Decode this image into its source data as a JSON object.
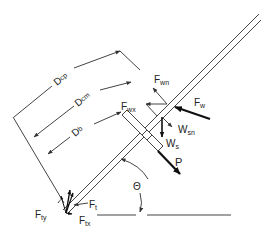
{
  "diagram": {
    "type": "free-body diagram",
    "colors": {
      "background": "#ffffff",
      "line": "#333333",
      "text": "#222222"
    },
    "labels": {
      "dcp": {
        "main": "D",
        "sub": "cp"
      },
      "dcm": {
        "main": "D",
        "sub": "cm"
      },
      "db": {
        "main": "D",
        "sub": "b"
      },
      "fwn": {
        "main": "F",
        "sub": "wn"
      },
      "fwx": {
        "main": "F",
        "sub": "wx"
      },
      "fw": {
        "main": "F",
        "sub": "w"
      },
      "wsn": {
        "main": "W",
        "sub": "sn"
      },
      "ws": {
        "main": "W",
        "sub": "s"
      },
      "p": {
        "main": "P"
      },
      "theta": {
        "main": "Θ"
      },
      "ft": {
        "main": "F",
        "sub": "t"
      },
      "fty": {
        "main": "F",
        "sub": "ty"
      },
      "ftx": {
        "main": "F",
        "sub": "tx"
      }
    },
    "elements": [
      "pole (double line)",
      "hand grip / block on pole",
      "dimension line Dcp",
      "dimension line Dcm",
      "dimension line Db",
      "wind force Fw and components Fwn, Fwx",
      "weight Ws and normal component Wsn",
      "applied force P",
      "tip forces Ft, Fty, Ftx",
      "angle Θ to horizontal ground line"
    ]
  }
}
